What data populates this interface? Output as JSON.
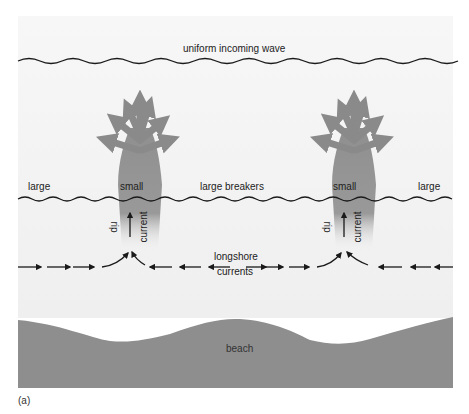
{
  "figure": {
    "title": "uniform incoming wave",
    "panel_label": "(a)",
    "colors": {
      "sea_background": "#f2f2f2",
      "beach": "#8e8e8e",
      "rip_current": "#8a8a8a",
      "wave_line": "#1a1a1a",
      "arrows": "#1a1a1a"
    }
  },
  "labels": {
    "incoming_wave": "uniform incoming wave",
    "breaker_left": "large",
    "breaker_small_left": "small",
    "breaker_middle": "large breakers",
    "breaker_small_right": "small",
    "breaker_right": "large",
    "rip_left": "rip",
    "current_left": "current",
    "rip_right": "rip",
    "current_right": "current",
    "longshore_line1": "longshore",
    "longshore_line2": "currents",
    "beach": "beach"
  }
}
